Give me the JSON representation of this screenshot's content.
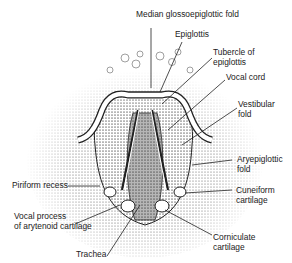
{
  "diagram": {
    "labels": {
      "median_glossoepiglottic_fold": "Median glossoepiglottic fold",
      "epiglottis": "Epiglottis",
      "tubercle_of_epiglottis": "Tubercle of\nepiglottis",
      "vocal_cord": "Vocal cord",
      "vestibular_fold": "Vestibular\nfold",
      "aryepiglottic_fold": "Aryepiglottic\nfold",
      "cuneiform_cartilage": "Cuneiform\ncartilage",
      "corniculate_cartilage": "Corniculate\ncartilage",
      "piriform_recess": "Piriform recess",
      "vocal_process": "Vocal process\nof arytenoid cartilage",
      "trachea": "Trachea"
    },
    "colors": {
      "ink": "#222222",
      "background": "#ffffff",
      "shade": "#9a9a9a"
    }
  }
}
